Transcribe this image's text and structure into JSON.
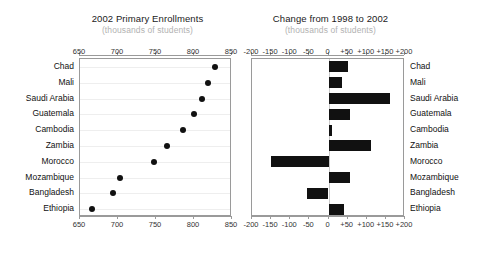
{
  "chart_data": [
    {
      "type": "scatter",
      "title": "2002 Primary Enrollments",
      "subtitle": "(thousands of students)",
      "xlabel": "",
      "ylabel": "",
      "xlim": [
        650,
        850
      ],
      "xticks": [
        650,
        700,
        750,
        800,
        850
      ],
      "xticklabels": [
        "650",
        "700",
        "750",
        "800",
        "850"
      ],
      "grid": true,
      "legend": "none",
      "categories": [
        "Chad",
        "Mali",
        "Saudi Arabia",
        "Guatemala",
        "Cambodia",
        "Zambia",
        "Morocco",
        "Mozambique",
        "Bangladesh",
        "Ethiopia"
      ],
      "values": [
        828,
        818,
        811,
        800,
        785,
        765,
        748,
        703,
        694,
        666
      ]
    },
    {
      "type": "bar",
      "title": "Change from 1998 to 2002",
      "subtitle": "(thousands of students)",
      "xlabel": "",
      "ylabel": "",
      "xlim": [
        -200,
        200
      ],
      "xticks": [
        -200,
        -150,
        -100,
        -50,
        0,
        50,
        100,
        150,
        200
      ],
      "xticklabels": [
        "-200",
        "-150",
        "-100",
        "-50",
        "0",
        "+50",
        "+100",
        "+150",
        "+200"
      ],
      "grid": false,
      "legend": "none",
      "orientation": "horizontal",
      "categories": [
        "Chad",
        "Mali",
        "Saudi Arabia",
        "Guatemala",
        "Cambodia",
        "Zambia",
        "Morocco",
        "Mozambique",
        "Bangladesh",
        "Ethiopia"
      ],
      "values": [
        50,
        35,
        160,
        55,
        8,
        110,
        -150,
        55,
        -55,
        40
      ]
    }
  ],
  "colors": {
    "marker": "#111111",
    "bar": "#111111",
    "axis": "#9a9a9a",
    "grid": "#eeeeee",
    "title_text": "#1a1a1a",
    "subtitle_text": "#b2b2b2",
    "tick_text": "#333333",
    "background": "#ffffff"
  }
}
